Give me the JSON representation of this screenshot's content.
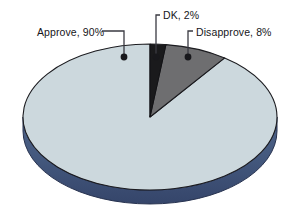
{
  "chart_data": {
    "type": "pie",
    "title": "",
    "subtitle": "",
    "xlabel": "",
    "ylabel": "",
    "legend_position": "callout-labels",
    "grid": false,
    "three_d": true,
    "categories": [
      "Approve",
      "DK",
      "Disapprove"
    ],
    "values": [
      90,
      2,
      8
    ],
    "units": "%",
    "slices": [
      {
        "label": "Approve",
        "value": 90,
        "value_text": "90%",
        "label_text": "Approve, 90%",
        "color": "#ccd8dd",
        "side_color": "#44597e"
      },
      {
        "label": "DK",
        "value": 2,
        "value_text": "2%",
        "label_text": "DK, 2%",
        "color": "#1a1a1c",
        "side_color": "#1a1a1c"
      },
      {
        "label": "Disapprove",
        "value": 8,
        "value_text": "8%",
        "label_text": "Disapprove, 8%",
        "color": "#6e6e70",
        "side_color": "#3f4a5e"
      }
    ],
    "annotations": [
      "Approve, 90%",
      "DK, 2%",
      "Disapprove, 8%"
    ]
  },
  "colors": {
    "background": "#ffffff",
    "approve_fill": "#ccd8dd",
    "dk_fill": "#1a1a1c",
    "disapprove_fill": "#6e6e70",
    "extrusion_side": "#44597e",
    "outline": "#1b1b1f",
    "leader_line": "#3a3a42",
    "label_text": "#16161a"
  }
}
